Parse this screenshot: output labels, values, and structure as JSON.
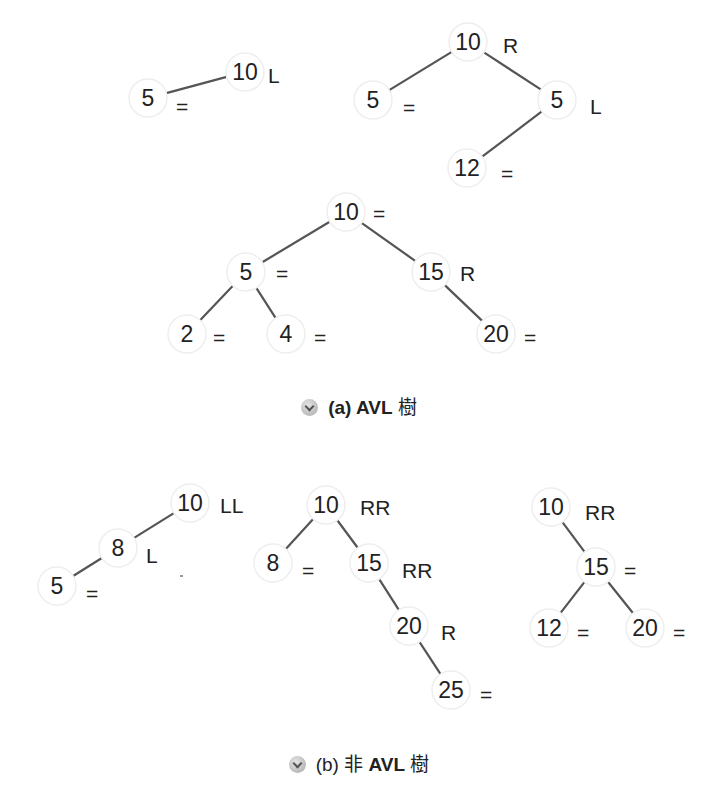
{
  "figure_a": {
    "caption_prefix": "(a) AVL",
    "caption_suffix": "樹",
    "trees": [
      {
        "name": "tree-a1",
        "nodes": [
          {
            "id": "a1n10",
            "value": "10",
            "balance": "L",
            "x": 245,
            "y": 72,
            "bx": 268,
            "by": 75
          },
          {
            "id": "a1n5",
            "value": "5",
            "balance": "=",
            "x": 148,
            "y": 98,
            "bx": 176,
            "by": 106
          }
        ],
        "edges": [
          [
            "a1n10",
            "a1n5"
          ]
        ]
      },
      {
        "name": "tree-a2",
        "nodes": [
          {
            "id": "a2n10",
            "value": "10",
            "balance": "R",
            "x": 468,
            "y": 42,
            "bx": 503,
            "by": 45
          },
          {
            "id": "a2n5l",
            "value": "5",
            "balance": "=",
            "x": 373,
            "y": 100,
            "bx": 403,
            "by": 107
          },
          {
            "id": "a2n5r",
            "value": "5",
            "balance": "L",
            "x": 557,
            "y": 100,
            "bx": 590,
            "by": 106
          },
          {
            "id": "a2n12",
            "value": "12",
            "balance": "=",
            "x": 467,
            "y": 168,
            "bx": 501,
            "by": 173
          }
        ],
        "edges": [
          [
            "a2n10",
            "a2n5l"
          ],
          [
            "a2n10",
            "a2n5r"
          ],
          [
            "a2n5r",
            "a2n12"
          ]
        ]
      },
      {
        "name": "tree-a3",
        "nodes": [
          {
            "id": "a3n10",
            "value": "10",
            "balance": "=",
            "x": 346,
            "y": 212,
            "bx": 373,
            "by": 213
          },
          {
            "id": "a3n5",
            "value": "5",
            "balance": "=",
            "x": 246,
            "y": 272,
            "bx": 276,
            "by": 273
          },
          {
            "id": "a3n15",
            "value": "15",
            "balance": "R",
            "x": 431,
            "y": 272,
            "bx": 460,
            "by": 273
          },
          {
            "id": "a3n2",
            "value": "2",
            "balance": "=",
            "x": 187,
            "y": 334,
            "bx": 213,
            "by": 337
          },
          {
            "id": "a3n4",
            "value": "4",
            "balance": "=",
            "x": 286,
            "y": 334,
            "bx": 314,
            "by": 337
          },
          {
            "id": "a3n20",
            "value": "20",
            "balance": "=",
            "x": 496,
            "y": 334,
            "bx": 524,
            "by": 337
          }
        ],
        "edges": [
          [
            "a3n10",
            "a3n5"
          ],
          [
            "a3n10",
            "a3n15"
          ],
          [
            "a3n5",
            "a3n2"
          ],
          [
            "a3n5",
            "a3n4"
          ],
          [
            "a3n15",
            "a3n20"
          ]
        ]
      }
    ]
  },
  "figure_b": {
    "caption_prefix": "(b)",
    "caption_mid": "非",
    "caption_label": "AVL",
    "caption_suffix": "樹",
    "trees": [
      {
        "name": "tree-b1",
        "nodes": [
          {
            "id": "b1n10",
            "value": "10",
            "balance": "LL",
            "x": 190,
            "y": 503,
            "bx": 220,
            "by": 505
          },
          {
            "id": "b1n8",
            "value": "8",
            "balance": "L",
            "x": 118,
            "y": 548,
            "bx": 146,
            "by": 555
          },
          {
            "id": "b1n5",
            "value": "5",
            "balance": "=",
            "x": 57,
            "y": 586,
            "bx": 86,
            "by": 593
          }
        ],
        "edges": [
          [
            "b1n10",
            "b1n8"
          ],
          [
            "b1n8",
            "b1n5"
          ]
        ]
      },
      {
        "name": "tree-b2",
        "nodes": [
          {
            "id": "b2n10",
            "value": "10",
            "balance": "RR",
            "x": 326,
            "y": 505,
            "bx": 360,
            "by": 507
          },
          {
            "id": "b2n8",
            "value": "8",
            "balance": "=",
            "x": 273,
            "y": 563,
            "bx": 302,
            "by": 570
          },
          {
            "id": "b2n15",
            "value": "15",
            "balance": "RR",
            "x": 369,
            "y": 563,
            "bx": 402,
            "by": 570
          },
          {
            "id": "b2n20",
            "value": "20",
            "balance": "R",
            "x": 409,
            "y": 626,
            "bx": 441,
            "by": 632
          },
          {
            "id": "b2n25",
            "value": "25",
            "balance": "=",
            "x": 451,
            "y": 690,
            "bx": 480,
            "by": 694
          }
        ],
        "edges": [
          [
            "b2n10",
            "b2n8"
          ],
          [
            "b2n10",
            "b2n15"
          ],
          [
            "b2n15",
            "b2n20"
          ],
          [
            "b2n20",
            "b2n25"
          ]
        ]
      },
      {
        "name": "tree-b3",
        "nodes": [
          {
            "id": "b3n10",
            "value": "10",
            "balance": "RR",
            "x": 551,
            "y": 507,
            "bx": 585,
            "by": 512
          },
          {
            "id": "b3n15",
            "value": "15",
            "balance": "=",
            "x": 596,
            "y": 567,
            "bx": 624,
            "by": 570
          },
          {
            "id": "b3n12",
            "value": "12",
            "balance": "=",
            "x": 549,
            "y": 628,
            "bx": 577,
            "by": 632
          },
          {
            "id": "b3n20",
            "value": "20",
            "balance": "=",
            "x": 645,
            "y": 628,
            "bx": 673,
            "by": 632
          }
        ],
        "edges": [
          [
            "b3n10",
            "b3n15"
          ],
          [
            "b3n15",
            "b3n12"
          ],
          [
            "b3n15",
            "b3n20"
          ]
        ]
      }
    ]
  },
  "colors": {
    "edge": "#555555",
    "text": "#222222",
    "node_fill": "#ffffff",
    "node_halo": "#eeeeee"
  }
}
